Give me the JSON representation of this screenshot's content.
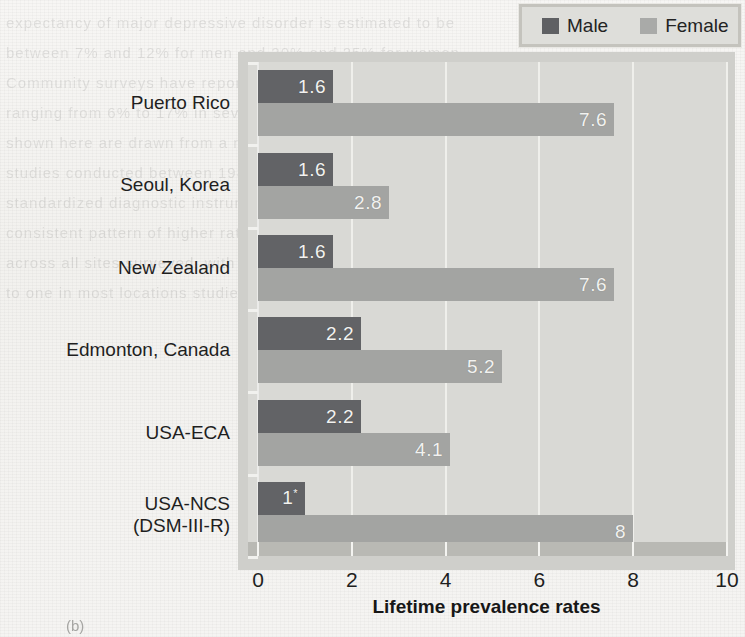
{
  "chart_data": {
    "type": "bar",
    "orientation": "horizontal",
    "title": "",
    "xlabel": "Lifetime prevalence rates",
    "ylabel": "Location",
    "xlim": [
      0,
      10
    ],
    "xticks": [
      0,
      2,
      4,
      6,
      8,
      10
    ],
    "xtick_labels": [
      "0",
      "2",
      "4",
      "6",
      "8",
      "10"
    ],
    "grid": true,
    "grid_axis": "x",
    "legend_position": "top-right",
    "categories": [
      "Puerto Rico",
      "Seoul, Korea",
      "New Zealand",
      "Edmonton, Canada",
      "USA-ECA",
      "USA-NCS (DSM-III-R)"
    ],
    "series": [
      {
        "name": "Male",
        "color": "#626366",
        "values": [
          1.6,
          1.6,
          1.6,
          2.2,
          2.2,
          1
        ],
        "labels": [
          "1.6",
          "1.6",
          "1.6",
          "2.2",
          "2.2",
          "1"
        ],
        "label_footnotes": [
          "",
          "",
          "",
          "",
          "",
          "*"
        ]
      },
      {
        "name": "Female",
        "color": "#a3a4a2",
        "values": [
          7.6,
          2.8,
          7.6,
          5.2,
          4.1,
          8
        ],
        "labels": [
          "7.6",
          "2.8",
          "7.6",
          "5.2",
          "4.1",
          "8"
        ],
        "label_footnotes": [
          "",
          "",
          "",
          "",
          "",
          ""
        ]
      }
    ]
  },
  "legend": {
    "entries": [
      {
        "label": "Male",
        "color": "#626366"
      },
      {
        "label": "Female",
        "color": "#a3a4a2"
      }
    ]
  },
  "axes": {
    "x_title": "Lifetime prevalence rates",
    "y_title": "Location"
  },
  "category_labels": [
    {
      "line1": "Puerto Rico",
      "line2": ""
    },
    {
      "line1": "Seoul, Korea",
      "line2": ""
    },
    {
      "line1": "New Zealand",
      "line2": ""
    },
    {
      "line1": "Edmonton, Canada",
      "line2": ""
    },
    {
      "line1": "USA-ECA",
      "line2": ""
    },
    {
      "line1": "USA-NCS",
      "line2": "(DSM-III-R)"
    }
  ],
  "figure": {
    "caption": "(b)"
  },
  "colors": {
    "male_bar": "#626366",
    "female_bar": "#a3a4a2",
    "plot_background": "#d9d9d5",
    "plot_frame": "#cfcfcb",
    "gridline": "#f0f0ec",
    "page_background": "#f4f3f1",
    "text": "#1f1f1f"
  }
}
